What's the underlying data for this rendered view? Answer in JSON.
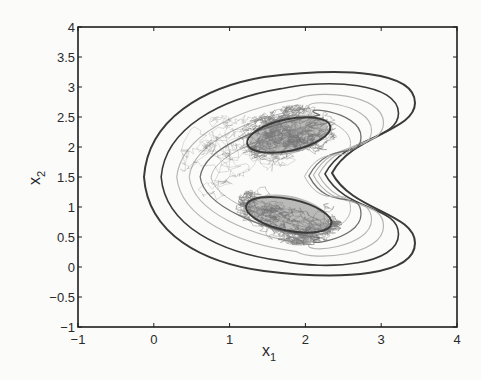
{
  "chart_data": {
    "type": "contour",
    "title": "",
    "xlabel": "x",
    "xlabel_subscript": "1",
    "ylabel": "x",
    "ylabel_subscript": "2",
    "xlim": [
      -1,
      4
    ],
    "ylim": [
      -1,
      4
    ],
    "grid": false,
    "legend": null,
    "x_ticks": [
      -1,
      0,
      1,
      2,
      3,
      4
    ],
    "y_ticks": [
      -1,
      -0.5,
      0,
      0.5,
      1,
      1.5,
      2,
      2.5,
      3,
      3.5,
      4
    ],
    "x_tick_labels": [
      "−1",
      "0",
      "1",
      "2",
      "3",
      "4"
    ],
    "y_tick_labels": [
      "−1",
      "−0.5",
      "0",
      "0.5",
      "1",
      "1.5",
      "2",
      "2.5",
      "3",
      "3.5",
      "4"
    ],
    "modes": [
      {
        "name": "upper mode",
        "center": [
          1.78,
          2.2
        ],
        "x_extent": [
          1.23,
          2.35
        ],
        "y_extent": [
          1.85,
          2.55
        ]
      },
      {
        "name": "lower mode",
        "center": [
          1.78,
          0.87
        ],
        "x_extent": [
          1.21,
          2.36
        ],
        "y_extent": [
          0.5,
          1.2
        ]
      }
    ],
    "outer_contour": {
      "left_tip": [
        -0.13,
        1.5
      ],
      "right_extent": 3.45,
      "top": 3.2,
      "bottom": -0.1,
      "notch": [
        2.35,
        1.6
      ]
    },
    "contour_levels_count": 6,
    "samples": "dense MCMC trajectory concentrated in both modes and the bridge region near x1≈1.2, x2≈1.5"
  },
  "colors": {
    "frame": "#1e1e1e",
    "contour_dark": "#3a3a3a",
    "contour_mid": "#6e6e6e",
    "contour_light": "#b5b5b5",
    "samples": "#7a7a7a",
    "background": "#fbfbfa"
  }
}
